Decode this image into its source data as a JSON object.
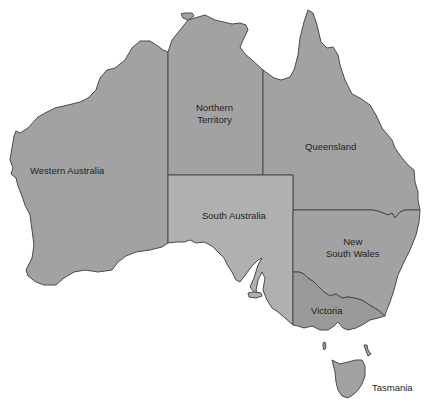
{
  "map": {
    "title": "Australia states and territories",
    "colors": {
      "default_fill": "#a2a2a2",
      "south_australia_fill": "#b0b0b0",
      "victoria_fill": "#9a9a9a",
      "border": "#3a3a3a",
      "background": "#ffffff"
    },
    "regions": [
      {
        "id": "western-australia",
        "label": "Western Australia"
      },
      {
        "id": "northern-territory",
        "label_line1": "Northern",
        "label_line2": "Territory"
      },
      {
        "id": "queensland",
        "label": "Queensland"
      },
      {
        "id": "south-australia",
        "label": "South Australia"
      },
      {
        "id": "new-south-wales",
        "label_line1": "New",
        "label_line2": "South Wales"
      },
      {
        "id": "victoria",
        "label": "Victoria"
      },
      {
        "id": "tasmania",
        "label": "Tasmania"
      }
    ]
  }
}
